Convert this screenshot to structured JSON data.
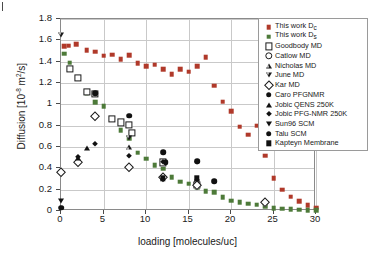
{
  "chart_data": {
    "type": "scatter",
    "title": "",
    "xlabel": "loading [molecules/uc]",
    "ylabel_prefix": "Diffusion [10",
    "ylabel_exp": "-8",
    "ylabel_mid": " m",
    "ylabel_sup": "2",
    "ylabel_suffix": "/s]",
    "xlim": [
      0,
      30
    ],
    "ylim": [
      0,
      1.8
    ],
    "xticks": [
      0,
      5,
      10,
      15,
      20,
      25,
      30
    ],
    "yticks": [
      0,
      0.2,
      0.4,
      0.6,
      0.8,
      1,
      1.2,
      1.4,
      1.6,
      1.8
    ],
    "xtick_labels": [
      "0",
      "5",
      "10",
      "15",
      "20",
      "25",
      "30"
    ],
    "ytick_labels": [
      "0",
      "0.2",
      "0.4",
      "0.6",
      "0.8",
      "1",
      "1.2",
      "1.4",
      "1.6",
      "1.8"
    ],
    "grid": true,
    "legend_position": "top-right",
    "colors": {
      "red": "#b0392a",
      "green": "#4d7a39",
      "black": "#111111",
      "grid": "#c9c9c9",
      "frame": "#8a8a8a"
    },
    "series": [
      {
        "name": "This work D",
        "sub": "c",
        "marker": "sq-fill-red",
        "color": "#b0392a",
        "points": [
          [
            0.4,
            1.545
          ],
          [
            0.9,
            1.55
          ],
          [
            1.8,
            1.565
          ],
          [
            3.0,
            1.505
          ],
          [
            4.0,
            1.495
          ],
          [
            5.0,
            1.455
          ],
          [
            6.0,
            1.465
          ],
          [
            7.0,
            1.425
          ],
          [
            8.0,
            1.46
          ],
          [
            9.0,
            1.385
          ],
          [
            10.0,
            1.355
          ],
          [
            11.0,
            1.37
          ],
          [
            12.0,
            1.33
          ],
          [
            13.0,
            1.285
          ],
          [
            14.0,
            1.33
          ],
          [
            15.0,
            1.305
          ],
          [
            16.0,
            1.36
          ],
          [
            17.0,
            1.44
          ],
          [
            18.0,
            1.175
          ],
          [
            19.0,
            1.025
          ],
          [
            20.0,
            0.935
          ],
          [
            21.0,
            0.79
          ],
          [
            22.0,
            0.715
          ],
          [
            23.0,
            0.8
          ],
          [
            24.0,
            0.52
          ],
          [
            25.0,
            0.305
          ],
          [
            26.0,
            0.2
          ],
          [
            27.0,
            0.135
          ],
          [
            28.0,
            0.09
          ],
          [
            29.0,
            0.055
          ],
          [
            30.0,
            0.03
          ]
        ]
      },
      {
        "name": "This work D",
        "sub": "s",
        "marker": "sq-fill-green",
        "color": "#4d7a39",
        "points": [
          [
            0.4,
            1.475
          ],
          [
            1.0,
            1.39
          ],
          [
            3.0,
            1.105
          ],
          [
            4.0,
            1.02
          ],
          [
            5.0,
            0.98
          ],
          [
            6.0,
            0.865
          ],
          [
            7.0,
            0.755
          ],
          [
            8.0,
            0.68
          ],
          [
            9.0,
            0.545
          ],
          [
            10.0,
            0.49
          ],
          [
            11.0,
            0.43
          ],
          [
            12.0,
            0.395
          ],
          [
            13.0,
            0.315
          ],
          [
            14.0,
            0.275
          ],
          [
            15.0,
            0.255
          ],
          [
            16.0,
            0.225
          ],
          [
            17.0,
            0.185
          ],
          [
            18.0,
            0.175
          ],
          [
            19.0,
            0.13
          ],
          [
            20.0,
            0.095
          ],
          [
            21.0,
            0.085
          ],
          [
            22.0,
            0.07
          ],
          [
            23.0,
            0.06
          ],
          [
            24.0,
            0.045
          ],
          [
            25.0,
            0.025
          ],
          [
            26.0,
            0.02
          ],
          [
            27.0,
            0.015
          ],
          [
            28.0,
            0.012
          ],
          [
            29.0,
            0.01
          ],
          [
            30.0,
            0.008
          ]
        ]
      },
      {
        "name": "Goodbody MD",
        "marker": "sq-open",
        "color": "#111111",
        "points": [
          [
            1.0,
            1.335
          ],
          [
            2.0,
            1.25
          ],
          [
            3.0,
            1.115
          ],
          [
            4.0,
            1.1
          ],
          [
            6.0,
            0.865
          ],
          [
            7.0,
            0.83
          ],
          [
            8.0,
            0.805
          ],
          [
            8.3,
            0.735
          ],
          [
            12.0,
            0.455
          ],
          [
            16.0,
            0.245
          ]
        ]
      },
      {
        "name": "Catlow MD",
        "marker": "ci-open",
        "color": "#111111",
        "points": [
          [
            16.0,
            0.255
          ]
        ]
      },
      {
        "name": "Nicholas MD",
        "marker": "tri-up-open",
        "color": "#111111",
        "points": [
          [
            8.0,
            0.6
          ]
        ]
      },
      {
        "name": "June MD",
        "marker": "tri-dn-open",
        "color": "#111111",
        "points": [
          [
            0.0,
            1.7
          ],
          [
            8.0,
            0.775
          ],
          [
            16.0,
            0.415
          ]
        ]
      },
      {
        "name": "Kar MD",
        "marker": "dia-open",
        "color": "#111111",
        "points": [
          [
            0.0,
            0.365
          ],
          [
            2.0,
            0.455
          ],
          [
            4.0,
            0.895
          ],
          [
            8.0,
            0.415
          ],
          [
            12.0,
            0.315
          ],
          [
            16.0,
            0.24
          ],
          [
            24.0,
            0.085
          ]
        ]
      },
      {
        "name": "Caro PFGNMR",
        "marker": "ci-fill",
        "color": "#111111",
        "points": [
          [
            4.0,
            1.105
          ],
          [
            8.0,
            0.895
          ],
          [
            12.0,
            0.55
          ],
          [
            12.3,
            0.455
          ],
          [
            16.0,
            0.465
          ],
          [
            18.0,
            0.28
          ]
        ]
      },
      {
        "name": "Jobic QENS 250K",
        "marker": "tri-up-fill",
        "color": "#111111",
        "points": [
          [
            2.0,
            0.5
          ],
          [
            3.0,
            0.595
          ]
        ]
      },
      {
        "name": "Jobic PFG-NMR 250K",
        "marker": "dia-fill",
        "color": "#111111",
        "points": [
          [
            2.0,
            0.505
          ],
          [
            4.0,
            0.63
          ],
          [
            8.0,
            0.52
          ],
          [
            12.0,
            0.455
          ],
          [
            16.0,
            0.46
          ]
        ]
      },
      {
        "name": "Sun96 SCM",
        "marker": "tri-dn-fill",
        "color": "#111111",
        "points": [
          [
            0.0,
            0.09
          ]
        ]
      },
      {
        "name": "Talu SCM",
        "marker": "ci-fill",
        "color": "#111111",
        "points": [
          [
            0.0,
            0.03
          ]
        ]
      },
      {
        "name": "Kapteyn Membrane",
        "marker": "sq-fill-blk",
        "color": "#111111",
        "points": [
          [
            12.0,
            0.305
          ],
          [
            16.0,
            0.305
          ]
        ]
      }
    ]
  },
  "legend": {
    "entries": [
      {
        "label": "This work D",
        "sub": "c",
        "marker": "sq-fill-red"
      },
      {
        "label": "This work D",
        "sub": "s",
        "marker": "sq-fill-green"
      },
      {
        "label": "Goodbody MD",
        "sub": "",
        "marker": "sq-open"
      },
      {
        "label": "Catlow MD",
        "sub": "",
        "marker": "ci-open"
      },
      {
        "label": "Nicholas MD",
        "sub": "",
        "marker": "tri-up-open"
      },
      {
        "label": "June MD",
        "sub": "",
        "marker": "tri-dn-open"
      },
      {
        "label": "Kar MD",
        "sub": "",
        "marker": "dia-open"
      },
      {
        "label": "Caro PFGNMR",
        "sub": "",
        "marker": "ci-fill"
      },
      {
        "label": "Jobic QENS 250K",
        "sub": "",
        "marker": "tri-up-fill"
      },
      {
        "label": "Jobic PFG-NMR 250K",
        "sub": "",
        "marker": "dia-fill"
      },
      {
        "label": "Sun96 SCM",
        "sub": "",
        "marker": "tri-dn-fill"
      },
      {
        "label": "Talu SCM",
        "sub": "",
        "marker": "ci-fill"
      },
      {
        "label": "Kapteyn Membrane",
        "sub": "",
        "marker": "sq-fill-blk"
      }
    ]
  }
}
